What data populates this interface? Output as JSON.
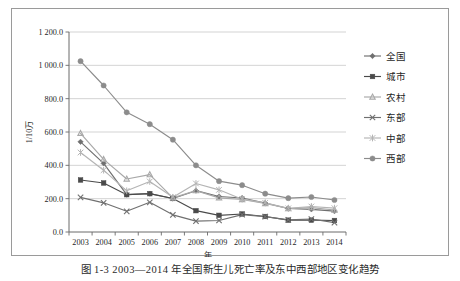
{
  "figure": {
    "caption": "图 1-3  2003—2014 年全国新生儿死亡率及东中西部地区变化趋势"
  },
  "chart_data": {
    "type": "line",
    "title": "",
    "xlabel": "年",
    "ylabel": "1/10万",
    "x": [
      2003,
      2004,
      2005,
      2006,
      2007,
      2008,
      2009,
      2010,
      2011,
      2012,
      2013,
      2014
    ],
    "xtick_labels": [
      "2003",
      "2004",
      "2005",
      "2006",
      "2007",
      "2008",
      "2009",
      "2010",
      "2011",
      "2012",
      "2013",
      "2014"
    ],
    "ytick_labels": [
      "0.0",
      "200.0",
      "400.0",
      "600.0",
      "800.0",
      "1 000.0",
      "1 200.0"
    ],
    "ytick_values": [
      0,
      200,
      400,
      600,
      800,
      1000,
      1200
    ],
    "ylim": [
      0,
      1200
    ],
    "grid": "horizontal",
    "legend_position": "right",
    "series": [
      {
        "name": "全国",
        "marker": "diamond",
        "color": "#6f6f6f",
        "values": [
          541,
          412,
          224,
          230,
          201,
          248,
          213,
          204,
          174,
          141,
          136,
          125
        ]
      },
      {
        "name": "城市",
        "marker": "square",
        "color": "#4a4a4a",
        "values": [
          312,
          294,
          224,
          230,
          201,
          128,
          100,
          108,
          93,
          71,
          71,
          69
        ]
      },
      {
        "name": "农村",
        "marker": "triangle",
        "color": "#a8a8a8",
        "values": [
          592,
          436,
          318,
          344,
          205,
          248,
          205,
          195,
          171,
          141,
          146,
          132
        ]
      },
      {
        "name": "东部",
        "marker": "x",
        "color": "#707070",
        "values": [
          208,
          175,
          124,
          178,
          103,
          65,
          69,
          104,
          92,
          73,
          78,
          56
        ]
      },
      {
        "name": "中部",
        "marker": "asterisk",
        "color": "#b4b4b4",
        "values": [
          477,
          371,
          247,
          303,
          208,
          291,
          253,
          197,
          175,
          142,
          153,
          143
        ]
      },
      {
        "name": "西部",
        "marker": "circle",
        "color": "#8c8c8c",
        "values": [
          1025,
          879,
          718,
          647,
          554,
          400,
          305,
          281,
          230,
          203,
          210,
          192
        ]
      }
    ]
  }
}
